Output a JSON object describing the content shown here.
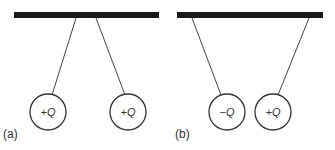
{
  "panels": [
    {
      "label": "(a)",
      "spheres": [
        {
          "charge_sign": "+",
          "charge_symbol": "Q",
          "text": "+Q"
        },
        {
          "charge_sign": "+",
          "charge_symbol": "Q",
          "text": "+Q"
        }
      ]
    },
    {
      "label": "(b)",
      "spheres": [
        {
          "charge_sign": "−",
          "charge_symbol": "Q",
          "text": "−Q"
        },
        {
          "charge_sign": "+",
          "charge_symbol": "Q",
          "text": "+Q"
        }
      ]
    }
  ],
  "colors": {
    "support_bar": "#1a1a1a",
    "string": "#444444",
    "sphere_outline": "#333333"
  }
}
